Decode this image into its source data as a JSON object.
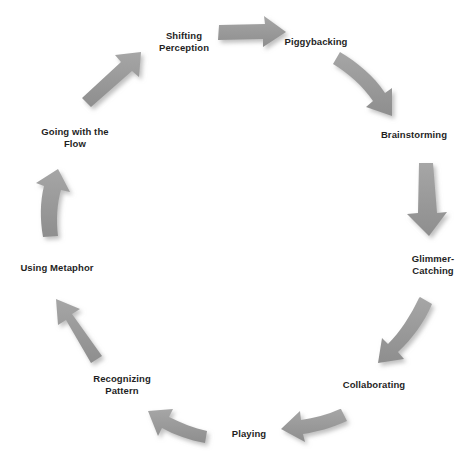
{
  "diagram": {
    "type": "cycle",
    "title": "",
    "background_color": "#ffffff",
    "arrow_color": "#9a9a9a",
    "arrow_shadow_color": "#c9c9c9",
    "label_color": "#1f1f1f",
    "direction": "clockwise",
    "node_count": 9,
    "arrow_count": 9,
    "nodes": [
      {
        "id": "shifting-perception",
        "label": "Shifting\nPerception",
        "x": 184,
        "y": 42
      },
      {
        "id": "piggybacking",
        "label": "Piggybacking",
        "x": 316,
        "y": 42
      },
      {
        "id": "brainstorming",
        "label": "Brainstorming",
        "x": 414,
        "y": 135
      },
      {
        "id": "glimmer-catching",
        "label": "Glimmer-\nCatching",
        "x": 433,
        "y": 265
      },
      {
        "id": "collaborating",
        "label": "Collaborating",
        "x": 374,
        "y": 385
      },
      {
        "id": "playing",
        "label": "Playing",
        "x": 249,
        "y": 434
      },
      {
        "id": "recognizing-pattern",
        "label": "Recognizing\nPattern",
        "x": 122,
        "y": 385
      },
      {
        "id": "using-metaphor",
        "label": "Using Metaphor",
        "x": 57,
        "y": 268
      },
      {
        "id": "going-with-the-flow",
        "label": "Going with the\nFlow",
        "x": 75,
        "y": 138
      }
    ],
    "arrows": [
      {
        "id": "arrow-shifting-to-piggybacking",
        "from": "shifting-perception",
        "to": "piggybacking",
        "shape": "straight-right"
      },
      {
        "id": "arrow-piggybacking-to-brainstorming",
        "from": "piggybacking",
        "to": "brainstorming",
        "shape": "curve-down-right"
      },
      {
        "id": "arrow-brainstorming-to-glimmer",
        "from": "brainstorming",
        "to": "glimmer-catching",
        "shape": "straight-down"
      },
      {
        "id": "arrow-glimmer-to-collaborating",
        "from": "glimmer-catching",
        "to": "collaborating",
        "shape": "curve-down-left"
      },
      {
        "id": "arrow-collaborating-to-playing",
        "from": "collaborating",
        "to": "playing",
        "shape": "curve-left-up"
      },
      {
        "id": "arrow-playing-to-recognizing",
        "from": "playing",
        "to": "recognizing-pattern",
        "shape": "curve-left-up"
      },
      {
        "id": "arrow-recognizing-to-metaphor",
        "from": "recognizing-pattern",
        "to": "using-metaphor",
        "shape": "diagonal-up-left"
      },
      {
        "id": "arrow-metaphor-to-flow",
        "from": "using-metaphor",
        "to": "going-with-the-flow",
        "shape": "straight-up"
      },
      {
        "id": "arrow-flow-to-shifting",
        "from": "going-with-the-flow",
        "to": "shifting-perception",
        "shape": "diagonal-up-right"
      }
    ]
  }
}
